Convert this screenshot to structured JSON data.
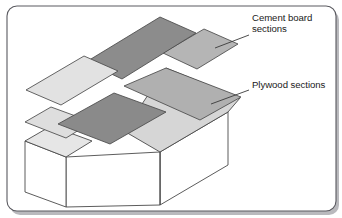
{
  "figure": {
    "frame": {
      "border_color": "#5a5a60",
      "shadow_color": "#b9b9bd",
      "background_color": "#ffffff",
      "corner_radius": 10
    },
    "palette": {
      "plywood_dark": "#8c8c8c",
      "plywood_dark_2": "#8a8a8a",
      "cement_medium": "#b5b5b5",
      "cement_medium_2": "#b0b0b0",
      "cement_light": "#e2e2e2",
      "cement_light_2": "#dedede",
      "box_face": "#ffffff",
      "box_top": "#e6e6e6",
      "outline": "#4a4a4a",
      "leader_line": "#3a3a3a"
    },
    "callouts": [
      {
        "id": "cement-board",
        "lines": [
          "Cement board",
          "sections"
        ],
        "text_x": 252,
        "text_y": 21,
        "line_height": 11,
        "leader": {
          "x1": 249,
          "y1": 35,
          "x2": 215,
          "y2": 48
        }
      },
      {
        "id": "plywood",
        "lines": [
          "Plywood sections"
        ],
        "text_x": 252,
        "text_y": 88,
        "line_height": 11,
        "leader": {
          "x1": 249,
          "y1": 90,
          "x2": 211,
          "y2": 104
        }
      }
    ],
    "panels": [
      {
        "id": "plywood-section-upper",
        "material": "plywood",
        "fill": "#8c8c8c",
        "points": "86,62 160,17 196,33 122,78"
      },
      {
        "id": "cement-board-section-upper-left",
        "material": "cement-board",
        "fill": "#e2e2e2",
        "points": "26,90 84,56 118,71 61,105"
      },
      {
        "id": "cement-board-section-upper-right",
        "material": "cement-board",
        "fill": "#b5b5b5",
        "points": "163,52 203,28 236,43 233,45 232,58 196,68"
      },
      {
        "id": "cement-board-section-main",
        "material": "cement-board",
        "fill": "#b0b0b0",
        "points": "124,86 166,68 232,95 233,103 202,120 126,90"
      },
      {
        "id": "plywood-section-lower",
        "material": "plywood",
        "fill": "#8a8a8a",
        "points": "58,124 114,93 166,112 110,144"
      },
      {
        "id": "cement-board-section-lower-left",
        "material": "cement-board",
        "fill": "#dedede",
        "points": "25,141 51,126 92,141 66,156"
      }
    ],
    "solid_box": {
      "id": "l-shaped-framing-box",
      "top_faces": [
        {
          "id": "box-top-right-arm",
          "fill": "#d8d8d8",
          "points": "166,68 240,98 228,112 160,152 124,130"
        },
        {
          "id": "box-top-left-arm",
          "fill": "#e6e6e6",
          "points": "25,141 51,126 92,141 66,157"
        }
      ],
      "side_faces": [
        {
          "id": "box-front-left",
          "fill": "#ffffff",
          "points": "25,141 66,157 66,207 25,192"
        },
        {
          "id": "box-front-long",
          "fill": "#ffffff",
          "points": "66,157 160,152 160,205 66,207"
        },
        {
          "id": "box-front-right",
          "fill": "#ffffff",
          "points": "160,152 228,112 228,165 160,205"
        }
      ]
    }
  }
}
